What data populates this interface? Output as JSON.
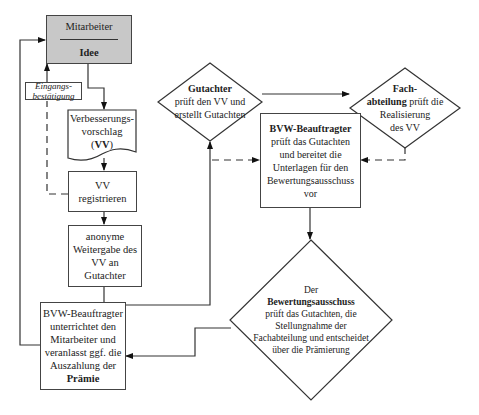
{
  "diagram": {
    "nodes": {
      "mitarbeiter": {
        "title": "Mitarbeiter",
        "subtitle": "Idee",
        "fill": "#c8c8c8"
      },
      "eingang": {
        "line1": "Eingangs-",
        "line2": "bestätigung"
      },
      "vv_doc": {
        "line1": "Verbesserungs-",
        "line2": "vorschlag",
        "line3_open": "(",
        "line3_bold": "VV",
        "line3_close": ")"
      },
      "vv_reg": {
        "line1": "VV",
        "line2": "registrieren"
      },
      "anonym": {
        "line1": "anonyme",
        "line2": "Weitergabe des",
        "line3": "VV an",
        "line4": "Gutachter"
      },
      "gutachter": {
        "title": "Gutachter",
        "line1": "prüft den VV und",
        "line2": "erstellt Gutachten"
      },
      "fach": {
        "title1": "Fach-",
        "title2": "abteilung",
        "rest": " prüft die",
        "line2": "Realisierung",
        "line3": "des VV"
      },
      "bvw_prueft": {
        "title": "BVW-Beauftragter",
        "line1": "prüft das Gutachten",
        "line2": "und bereitet die",
        "line3": "Unterlagen für den",
        "line4": "Bewertungsausschuss",
        "line5": "vor"
      },
      "bewertung": {
        "line0": "Der",
        "title": "Bewertungsausschuss",
        "line1": "prüft das Gutachten, die",
        "line2": "Stellungnahme der",
        "line3": "Fachabteilung und entscheidet",
        "line4": "über die Prämierung"
      },
      "bvw_praemie": {
        "line1": "BVW-Beauftragter",
        "line2": "unterrichtet den",
        "line3": "Mitarbeiter und",
        "line4": "veranlasst ggf. die",
        "line5": "Auszahlung der",
        "title": "Prämie"
      }
    }
  }
}
